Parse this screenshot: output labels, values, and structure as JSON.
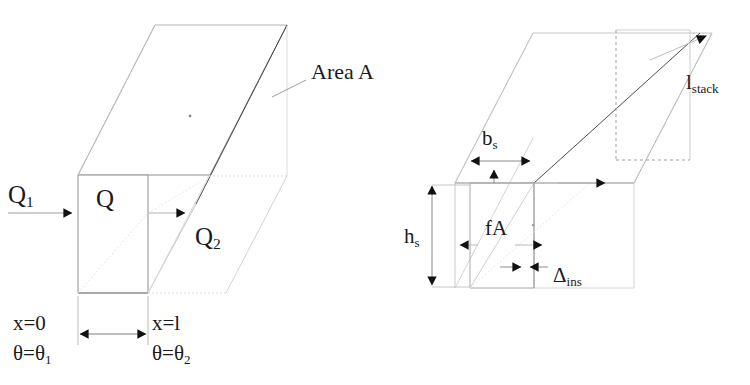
{
  "diagram": {
    "title_present": false,
    "panels": [
      {
        "id": "left-duct",
        "name": "one-dimensional-conduction-element",
        "labels": {
          "inlet_flow": "Q",
          "inlet_flow_sub": "1",
          "element_flow": "Q",
          "outlet_flow": "Q",
          "outlet_flow_sub": "2",
          "area": "Area A",
          "x_start": "x=0",
          "theta_start": "θ=θ",
          "theta_start_sub": "1",
          "x_end": "x=l",
          "theta_end": "θ=θ",
          "theta_end_sub": "2"
        }
      },
      {
        "id": "right-stack",
        "name": "insulated-stack-cross-section",
        "labels": {
          "breadth": "b",
          "breadth_sub": "s",
          "height": "h",
          "height_sub": "s",
          "inner_area": "fA",
          "insulation_thickness": "Δ",
          "insulation_thickness_sub": "ins",
          "stack_length": "l",
          "stack_length_sub": "stack"
        }
      }
    ]
  },
  "style": {
    "line_color": "#9a9a9a",
    "edge_color": "#6f6f6f",
    "dark_edge_color": "#3c3c3c",
    "dashed_color": "#b0b0b0",
    "arrow_color": "#111111",
    "background": "#ffffff",
    "text_color": "#1a1a1a"
  },
  "icons": {
    "arrow_right": "arrow-right-icon",
    "arrow_left": "arrow-left-icon",
    "arrow_up": "arrow-up-icon",
    "arrow_down": "arrow-down-icon",
    "leader_line": "leader-line-icon"
  }
}
